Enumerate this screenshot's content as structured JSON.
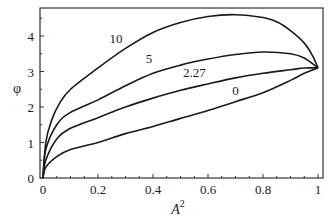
{
  "chart_data": {
    "type": "line",
    "title": "",
    "xlabel": "A^2",
    "ylabel": "φ",
    "xlim": [
      0,
      1
    ],
    "ylim": [
      0,
      4.8
    ],
    "grid": false,
    "legend": "none (inline curve labels)",
    "x_ticks": [
      "0",
      "0.2",
      "0.4",
      "0.6",
      "0.8",
      "1"
    ],
    "y_ticks": [
      "0",
      "1",
      "2",
      "3",
      "4"
    ],
    "series": [
      {
        "name": "0",
        "label_pos": [
          0.7,
          2.35
        ],
        "x": [
          0,
          0.01,
          0.05,
          0.1,
          0.2,
          0.3,
          0.4,
          0.5,
          0.6,
          0.7,
          0.8,
          0.9,
          0.95,
          1.0
        ],
        "y": [
          0,
          0.3,
          0.6,
          0.8,
          1.0,
          1.25,
          1.45,
          1.68,
          1.9,
          2.15,
          2.4,
          2.75,
          2.95,
          3.1
        ]
      },
      {
        "name": "2.27",
        "label_pos": [
          0.55,
          2.85
        ],
        "x": [
          0,
          0.01,
          0.05,
          0.1,
          0.2,
          0.3,
          0.4,
          0.5,
          0.6,
          0.7,
          0.8,
          0.9,
          0.95,
          1.0
        ],
        "y": [
          0,
          0.5,
          1.1,
          1.4,
          1.7,
          2.0,
          2.25,
          2.47,
          2.65,
          2.82,
          2.95,
          3.05,
          3.1,
          3.1
        ]
      },
      {
        "name": "5",
        "label_pos": [
          0.385,
          3.25
        ],
        "x": [
          0,
          0.01,
          0.05,
          0.1,
          0.2,
          0.3,
          0.4,
          0.5,
          0.6,
          0.7,
          0.8,
          0.9,
          0.95,
          1.0
        ],
        "y": [
          0,
          0.8,
          1.5,
          1.85,
          2.2,
          2.6,
          2.95,
          3.18,
          3.35,
          3.48,
          3.55,
          3.5,
          3.38,
          3.1
        ]
      },
      {
        "name": "10",
        "label_pos": [
          0.265,
          3.8
        ],
        "x": [
          0,
          0.01,
          0.03,
          0.06,
          0.1,
          0.2,
          0.3,
          0.4,
          0.5,
          0.6,
          0.7,
          0.8,
          0.85,
          0.9,
          0.95,
          0.98,
          1.0
        ],
        "y": [
          0,
          1.0,
          1.6,
          2.1,
          2.5,
          3.1,
          3.65,
          4.1,
          4.38,
          4.55,
          4.6,
          4.52,
          4.4,
          4.15,
          3.8,
          3.45,
          3.1
        ]
      }
    ]
  },
  "labels": {
    "x_axis_title_base": "A",
    "x_axis_title_sup": "2",
    "y_axis_title": "φ"
  }
}
